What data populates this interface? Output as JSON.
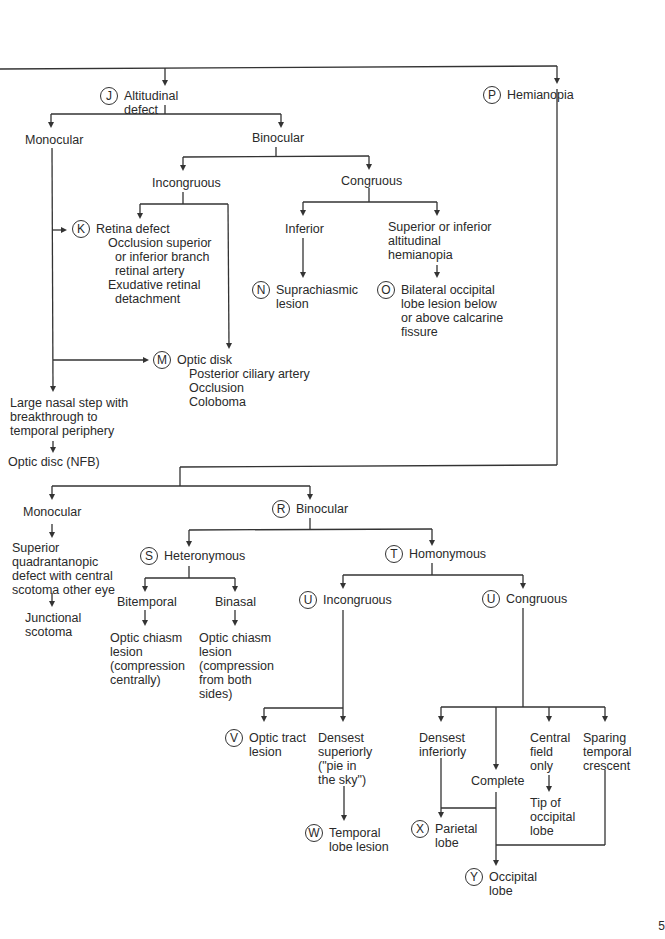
{
  "diagram": {
    "type": "visual-field-defect-decision-tree",
    "nodes": {
      "altitudinal": {
        "badge": "J",
        "label": "Altitudinal\ndefect"
      },
      "hemianopia": {
        "badge": "P",
        "label": "Hemianopia"
      },
      "alt_monocular": {
        "label": "Monocular"
      },
      "alt_binocular": {
        "label": "Binocular"
      },
      "alt_incongruous": {
        "label": "Incongruous"
      },
      "alt_congruous": {
        "label": "Congruous"
      },
      "retina": {
        "badge": "K",
        "label": "Retina defect",
        "details": [
          "Occlusion superior",
          "  or inferior branch",
          "  retinal artery",
          "Exudative retinal",
          "  detachment"
        ]
      },
      "inferior": {
        "label": "Inferior"
      },
      "sup_inf_alt": {
        "label": "Superior or inferior\naltitudinal\nhemianopia"
      },
      "suprachiasmic": {
        "badge": "N",
        "label": "Suprachiasmic\nlesion"
      },
      "bilateral_occ": {
        "badge": "O",
        "label": "Bilateral occipital\nlobe lesion below\nor above calcarine\nfissure"
      },
      "optic_disk": {
        "badge": "M",
        "label": "Optic disk",
        "details": [
          "Posterior ciliary artery",
          "Occlusion",
          "Coloboma"
        ]
      },
      "nasal_step": {
        "label": "Large nasal step with\nbreakthrough to\ntemporal periphery"
      },
      "optic_disc_nfb": {
        "label": "Optic disc (NFB)"
      },
      "hem_monocular": {
        "label": "Monocular"
      },
      "hem_binocular": {
        "badge": "R",
        "label": "Binocular"
      },
      "sup_quadrant": {
        "label": "Superior\nquadrantanopic\ndefect with central\nscotoma other eye"
      },
      "junctional": {
        "label": "Junctional\nscotoma"
      },
      "heteronymous": {
        "badge": "S",
        "label": "Heteronymous"
      },
      "homonymous": {
        "badge": "T",
        "label": "Homonymous"
      },
      "bitemporal": {
        "label": "Bitemporal"
      },
      "binasal": {
        "label": "Binasal"
      },
      "chiasm_central": {
        "label": "Optic chiasm\nlesion\n(compression\ncentrally)"
      },
      "chiasm_sides": {
        "label": "Optic chiasm\nlesion\n(compression\nfrom both\nsides)"
      },
      "hom_incongruous": {
        "badge": "U",
        "label": "Incongruous"
      },
      "hom_congruous": {
        "badge": "U",
        "label": "Congruous"
      },
      "optic_tract": {
        "badge": "V",
        "label": "Optic tract\nlesion"
      },
      "densest_sup": {
        "label": "Densest\nsuperiorly\n(\"pie in\nthe sky\")"
      },
      "temporal_lobe": {
        "badge": "W",
        "label": "Temporal\nlobe lesion"
      },
      "densest_inf": {
        "label": "Densest\ninferiorly"
      },
      "complete": {
        "label": "Complete"
      },
      "central_field": {
        "label": "Central\nfield\nonly"
      },
      "sparing_temporal": {
        "label": "Sparing\ntemporal\ncrescent"
      },
      "tip_occipital": {
        "label": "Tip of\noccipital\nlobe"
      },
      "parietal": {
        "badge": "X",
        "label": "Parietal\nlobe"
      },
      "occipital": {
        "badge": "Y",
        "label": "Occipital\nlobe"
      }
    },
    "page_number": "5"
  }
}
